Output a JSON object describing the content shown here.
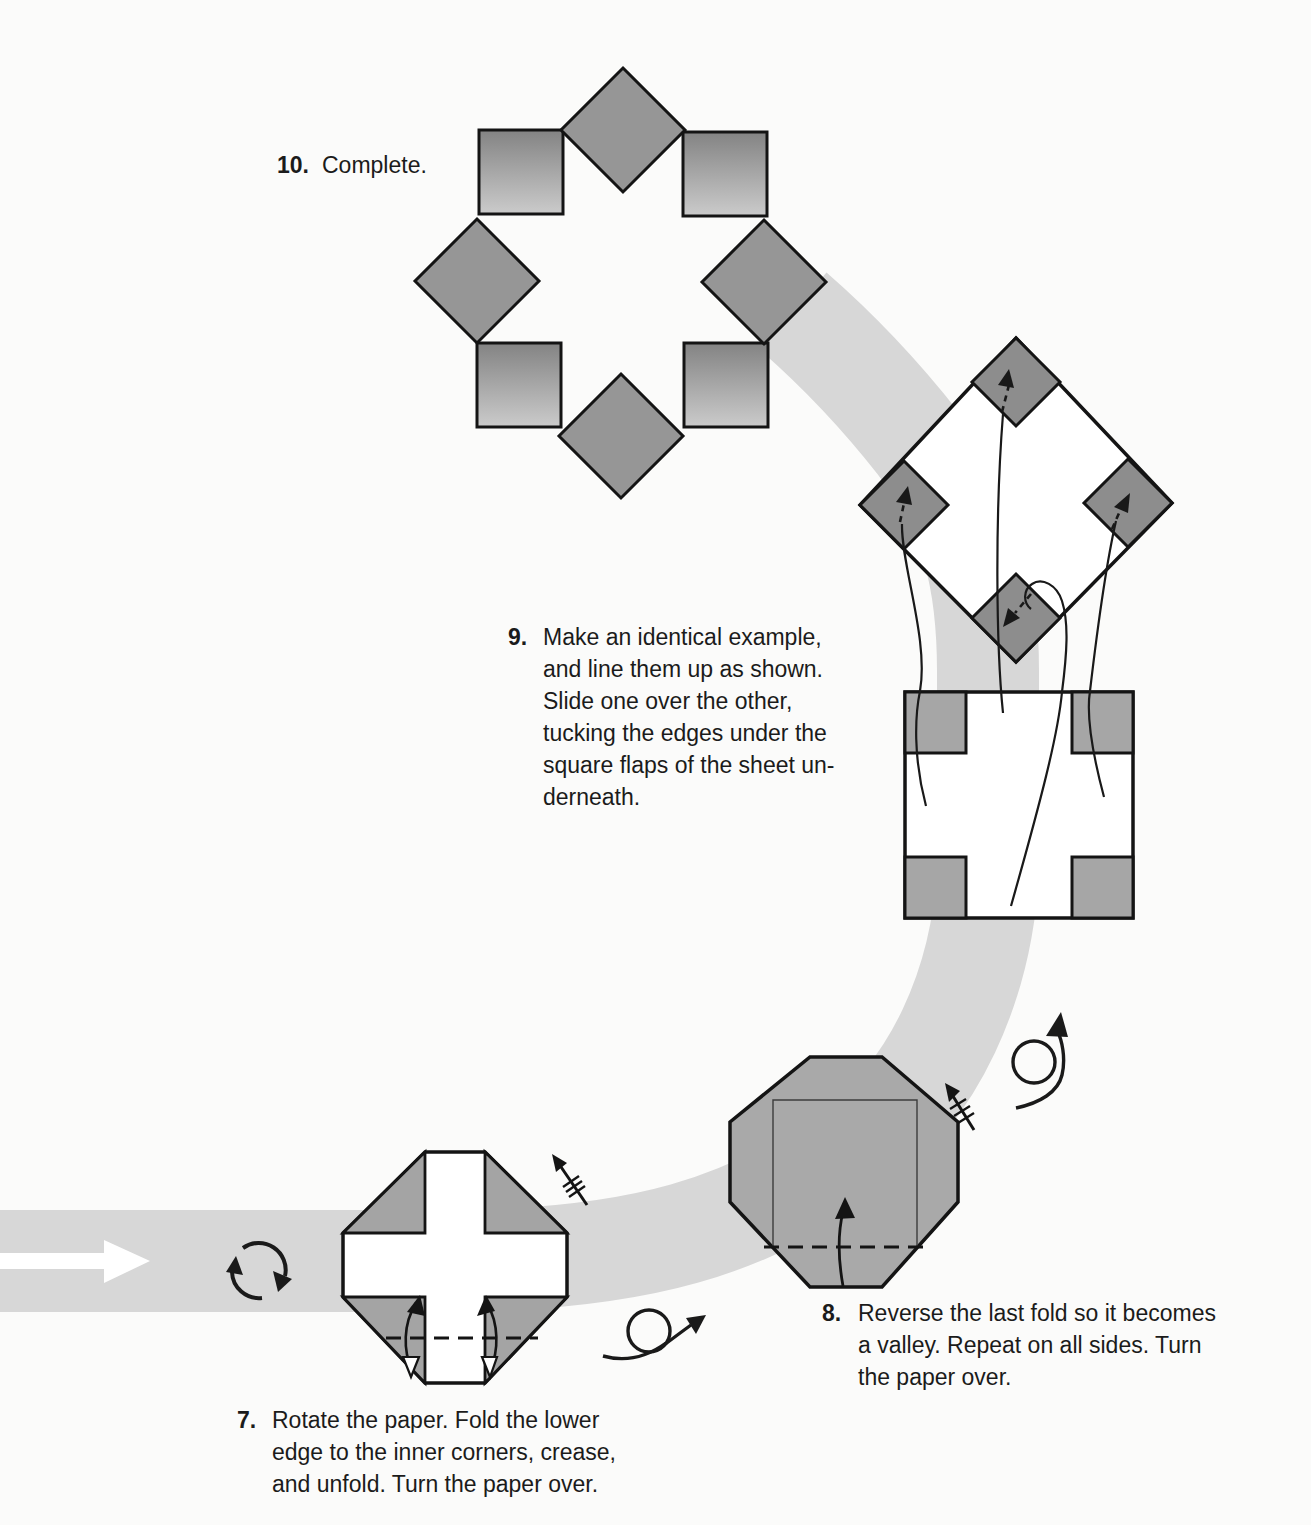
{
  "steps": [
    {
      "number": "7.",
      "lines": [
        "Rotate the paper. Fold the lower",
        "edge to the inner corners, crease,",
        "and unfold. Turn the paper over."
      ]
    },
    {
      "number": "8.",
      "lines": [
        "Reverse the last fold so it becomes",
        "a valley. Repeat on all sides. Turn",
        "the paper over."
      ]
    },
    {
      "number": "9.",
      "lines": [
        "Make an identical example,",
        "and line them up as shown.",
        "Slide one over the other,",
        "tucking the edges under the",
        "square flaps of the sheet un-",
        "derneath."
      ]
    },
    {
      "number": "10.",
      "lines": [
        "Complete."
      ]
    }
  ],
  "icons": {
    "flow_arrow": "white block arrow pointing right",
    "rotate_paper": "two curved arrows forming a circle",
    "turn_over": "loop-the-loop arrow",
    "fold_unfold_repeat": "arrow shaft with three hatch marks",
    "valley_fold": "dashed line",
    "fold_direction": "curved arrow with solid head",
    "tuck_guide": "long thin slide curves with dashed arrow tips"
  },
  "colors": {
    "paper_white": "#ffffff",
    "flow_band_gray": "#d7d7d7",
    "diamond_gray": "#969696",
    "dark_diamond_gray": "#8d8d8d",
    "flap_gray": "#a6a6a6",
    "octagon_gray": "#a9a9a9",
    "square_gradient_top": "#838383",
    "square_gradient_bottom": "#cbcbcb",
    "outline_black": "#141414",
    "text_black": "#1b1b1b"
  }
}
